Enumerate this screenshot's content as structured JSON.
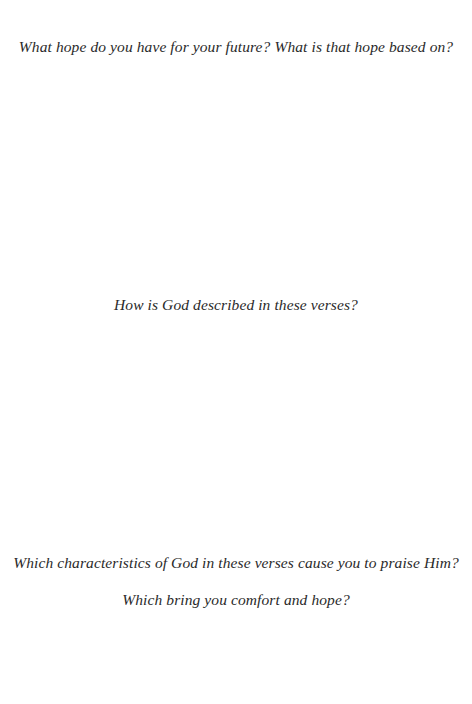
{
  "page": {
    "background": "#ffffff",
    "text_color": "#2a2a2a"
  },
  "questions": [
    {
      "lines": [
        "What hope do you have for your future? What is that hope based on?"
      ]
    },
    {
      "lines": [
        "How is God described in these verses?"
      ]
    },
    {
      "lines": [
        "Which characteristics of God in these verses cause you to praise Him?",
        "Which bring you comfort and hope?"
      ]
    }
  ]
}
